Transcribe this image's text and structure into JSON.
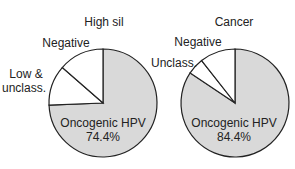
{
  "chart_data": [
    {
      "type": "pie",
      "title": "High sil",
      "slices": [
        {
          "label": "Oncogenic HPV",
          "value": 74.4,
          "display": "74.4%",
          "color": "#d9d9d9"
        },
        {
          "label": "Low & unclass.",
          "value": 12.0,
          "color": "#ffffff"
        },
        {
          "label": "Negative",
          "value": 13.6,
          "color": "#ffffff"
        }
      ]
    },
    {
      "type": "pie",
      "title": "Cancer",
      "slices": [
        {
          "label": "Oncogenic HPV",
          "value": 84.4,
          "display": "84.4%",
          "color": "#d9d9d9"
        },
        {
          "label": "Unclass.",
          "value": 5.0,
          "color": "#ffffff"
        },
        {
          "label": "Negative",
          "value": 10.6,
          "color": "#ffffff"
        }
      ]
    }
  ]
}
